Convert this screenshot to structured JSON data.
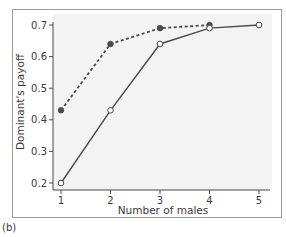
{
  "panel_label": "(b)",
  "chart_data": {
    "type": "line",
    "title": "",
    "xlabel": "Number of males",
    "ylabel": "Dominant's payoff",
    "x": [
      1,
      2,
      3,
      4,
      5
    ],
    "xticks": [
      "1",
      "2",
      "3",
      "4",
      "5"
    ],
    "yticks": [
      "0.2",
      "0.3",
      "0.4",
      "0.5",
      "0.6",
      "0.7"
    ],
    "ylim": [
      0.18,
      0.72
    ],
    "xlim": [
      0.85,
      5.2
    ],
    "grid": false,
    "legend": null,
    "series": [
      {
        "name": "dashed (filled circles)",
        "style": "dashed",
        "marker": "filled-circle",
        "x": [
          1,
          2,
          3,
          4
        ],
        "values": [
          0.43,
          0.64,
          0.69,
          0.7
        ]
      },
      {
        "name": "solid (open circles)",
        "style": "solid",
        "marker": "open-circle",
        "x": [
          1,
          2,
          3,
          4,
          5
        ],
        "values": [
          0.2,
          0.43,
          0.64,
          0.69,
          0.7
        ]
      }
    ]
  },
  "colors": {
    "line": "#4a4a4a",
    "plot_bg": "#f3f3f3",
    "frame": "#9a9a9a"
  }
}
